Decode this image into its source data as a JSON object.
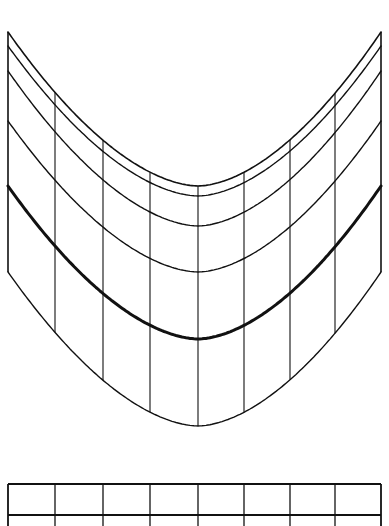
{
  "diagram": {
    "stroke_color": "#111111",
    "background": "#ffffff",
    "curved_grid": {
      "left_x": 8,
      "right_x": 381,
      "center_x": 198,
      "vertical_lines_x": [
        8,
        55,
        103,
        150,
        198,
        244,
        290,
        335,
        381
      ],
      "side_edge_bottom_y": 272,
      "curves": [
        {
          "name": "top-curve",
          "edge_y": 32,
          "center_y": 186,
          "width": 1.6
        },
        {
          "name": "curve-2",
          "edge_y": 46,
          "center_y": 196,
          "width": 1.4
        },
        {
          "name": "curve-3",
          "edge_y": 71,
          "center_y": 226,
          "width": 1.4
        },
        {
          "name": "curve-4",
          "edge_y": 121,
          "center_y": 272,
          "width": 1.4
        },
        {
          "name": "thick-curve",
          "edge_y": 186,
          "center_y": 339,
          "width": 3
        },
        {
          "name": "bottom-curve",
          "edge_y": 272,
          "center_y": 426,
          "width": 1.4
        }
      ]
    },
    "flat_grid": {
      "left_x": 8,
      "right_x": 381,
      "top_y": 484,
      "row_line_y": 515,
      "bottom_y": 526,
      "vertical_lines_x": [
        8,
        55,
        103,
        150,
        198,
        244,
        290,
        335,
        381
      ]
    }
  }
}
